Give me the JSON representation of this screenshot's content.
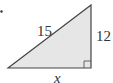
{
  "diagram": {
    "type": "right-triangle",
    "labels": {
      "hypotenuse": "15",
      "vertical_leg": "12",
      "horizontal_leg": "x"
    },
    "colors": {
      "fill": "#e6e6e6",
      "stroke": "#444444"
    }
  }
}
